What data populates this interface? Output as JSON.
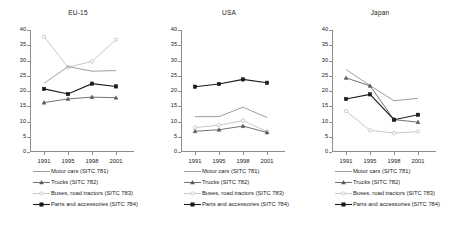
{
  "figure": {
    "yaxis": {
      "ticks": [
        0,
        5,
        10,
        15,
        20,
        25,
        30,
        35,
        40
      ],
      "min": 0,
      "max": 40
    },
    "xaxis": {
      "ticks": [
        "1991",
        "1995",
        "1998",
        "2001"
      ]
    },
    "series_styles": [
      {
        "key": "motor_cars",
        "color": "#8c8c8c",
        "marker": "none"
      },
      {
        "key": "trucks",
        "color": "#595959",
        "marker": "triangle"
      },
      {
        "key": "buses",
        "color": "#bfbfbf",
        "marker": "circle"
      },
      {
        "key": "parts",
        "color": "#1a1a1a",
        "marker": "square"
      }
    ],
    "legend": [
      {
        "label": "Motor cars (SITC 781)"
      },
      {
        "label": "Trucks (SITC 782)"
      },
      {
        "label": "Buses, road tractors (SITC 783)"
      },
      {
        "label": "Parts and accessories (SITC 784)"
      }
    ]
  },
  "chart_data": [
    {
      "type": "line",
      "title": "EU-15",
      "xlabel": "",
      "ylabel": "",
      "categories": [
        "1991",
        "1995",
        "1998",
        "2001"
      ],
      "ylim": [
        0,
        40
      ],
      "yticks": [
        0,
        5,
        10,
        15,
        20,
        25,
        30,
        35,
        40
      ],
      "grid": false,
      "legend_position": "below",
      "series": [
        {
          "name": "Motor cars (SITC 781)",
          "values": [
            22.5,
            28.0,
            26.5,
            26.7
          ]
        },
        {
          "name": "Trucks (SITC 782)",
          "values": [
            16.2,
            17.4,
            18.0,
            17.8
          ]
        },
        {
          "name": "Buses, road tractors (SITC 783)",
          "values": [
            37.8,
            27.8,
            29.7,
            36.8
          ]
        },
        {
          "name": "Parts and accessories (SITC 784)",
          "values": [
            20.7,
            19.0,
            22.4,
            21.5
          ]
        }
      ]
    },
    {
      "type": "line",
      "title": "USA",
      "xlabel": "",
      "ylabel": "",
      "categories": [
        "1991",
        "1995",
        "1998",
        "2001"
      ],
      "ylim": [
        0,
        40
      ],
      "yticks": [
        0,
        5,
        10,
        15,
        20,
        25,
        30,
        35,
        40
      ],
      "grid": false,
      "legend_position": "below",
      "series": [
        {
          "name": "Motor cars (SITC 781)",
          "values": [
            11.6,
            11.6,
            14.7,
            11.3
          ]
        },
        {
          "name": "Trucks (SITC 782)",
          "values": [
            6.8,
            7.3,
            8.5,
            6.4
          ]
        },
        {
          "name": "Buses, road tractors (SITC 783)",
          "values": [
            8.0,
            8.8,
            10.3,
            6.7
          ]
        },
        {
          "name": "Parts and accessories (SITC 784)",
          "values": [
            21.4,
            22.3,
            23.8,
            22.7
          ]
        }
      ]
    },
    {
      "type": "line",
      "title": "Japan",
      "xlabel": "",
      "ylabel": "",
      "categories": [
        "1991",
        "1995",
        "1998",
        "2001"
      ],
      "ylim": [
        0,
        40
      ],
      "yticks": [
        0,
        5,
        10,
        15,
        20,
        25,
        30,
        35,
        40
      ],
      "grid": false,
      "legend_position": "below",
      "series": [
        {
          "name": "Motor cars (SITC 781)",
          "values": [
            27.0,
            21.8,
            16.8,
            17.6
          ]
        },
        {
          "name": "Trucks (SITC 782)",
          "values": [
            24.3,
            21.7,
            10.6,
            9.8
          ]
        },
        {
          "name": "Buses, road tractors (SITC 783)",
          "values": [
            13.4,
            7.1,
            6.2,
            6.7
          ]
        },
        {
          "name": "Parts and accessories (SITC 784)",
          "values": [
            17.4,
            18.9,
            10.6,
            12.2
          ]
        }
      ]
    }
  ]
}
